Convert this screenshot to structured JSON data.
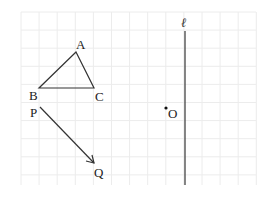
{
  "figure": {
    "grid": {
      "x0": 21,
      "y0": 12,
      "x1": 256,
      "y1": 185,
      "cell": 18.1,
      "color": "#ececec"
    },
    "triangle": {
      "vertices": {
        "A": [
          76,
          52
        ],
        "B": [
          39,
          88
        ],
        "C": [
          94,
          88
        ]
      },
      "labels": {
        "A": "A",
        "B": "B",
        "C": "C"
      }
    },
    "vector": {
      "from": [
        40,
        107
      ],
      "to": [
        94,
        163
      ],
      "labels": {
        "P": "P",
        "Q": "Q"
      }
    },
    "line": {
      "x": 185,
      "y_top": 31,
      "y_bottom": 185,
      "label": "ℓ"
    },
    "point": {
      "pos": [
        166,
        108
      ],
      "label": "O"
    },
    "stroke_color": "#333333"
  }
}
